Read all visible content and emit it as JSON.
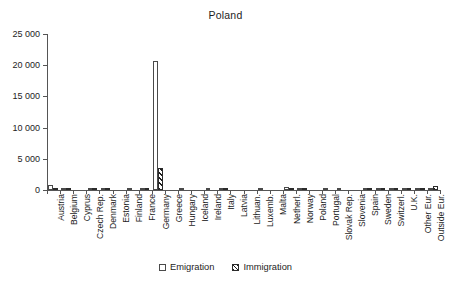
{
  "chart_data": {
    "type": "bar",
    "title": "Poland",
    "xlabel": "",
    "ylabel": "",
    "ylim": [
      0,
      25000
    ],
    "yticks": [
      0,
      5000,
      10000,
      15000,
      20000,
      25000
    ],
    "ytick_labels": [
      "0",
      "5 000",
      "10 000",
      "15 000",
      "20 000",
      "25 000"
    ],
    "grid": false,
    "legend_position": "bottom",
    "categories": [
      "Austria",
      "Belgium",
      "Cyprus",
      "Czech Rep.",
      "Denmark",
      "Estonia",
      "Finland",
      "France",
      "Germany",
      "Greece",
      "Hungary",
      "Iceland",
      "Ireland",
      "Italy",
      "Latvia",
      "Lithuan.",
      "Luxemb.",
      "Malta",
      "Netherl.",
      "Norway",
      "Poland",
      "Portugal",
      "Slovak Rep.",
      "Slovenia",
      "Spain",
      "Sweden",
      "Switzerl.",
      "U.K.",
      "Other Eur.",
      "Outside Eur."
    ],
    "series": [
      {
        "name": "Emigration",
        "style": "open",
        "values": [
          800,
          120,
          0,
          60,
          180,
          0,
          20,
          110,
          20700,
          0,
          10,
          0,
          30,
          120,
          0,
          0,
          20,
          0,
          520,
          170,
          0,
          10,
          20,
          0,
          40,
          180,
          200,
          230,
          170,
          380
        ]
      },
      {
        "name": "Immigration",
        "style": "hatched",
        "values": [
          60,
          20,
          0,
          20,
          40,
          0,
          0,
          30,
          3550,
          0,
          0,
          0,
          0,
          30,
          0,
          0,
          0,
          0,
          70,
          40,
          0,
          0,
          0,
          0,
          10,
          40,
          50,
          60,
          360,
          700
        ]
      }
    ]
  },
  "legend": {
    "items": [
      {
        "label": "Emigration",
        "swatch": "open-square-icon"
      },
      {
        "label": "Immigration",
        "swatch": "hatched-square-icon"
      }
    ]
  }
}
